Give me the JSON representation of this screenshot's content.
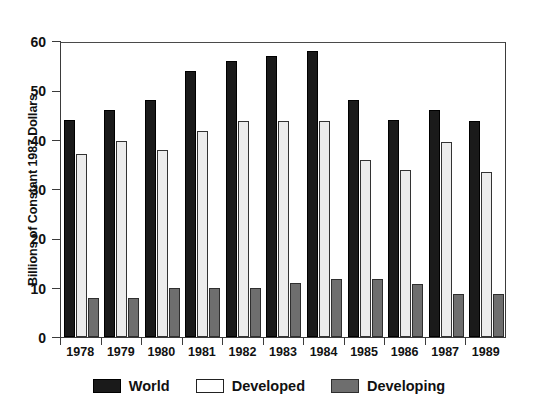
{
  "chart_data": {
    "type": "bar",
    "title": "",
    "subtitle": "",
    "xlabel": "",
    "ylabel": "Billions of Constant 1987 Dollars",
    "categories": [
      "1978",
      "1979",
      "1980",
      "1981",
      "1982",
      "1983",
      "1984",
      "1985",
      "1986",
      "1987",
      "1989"
    ],
    "series": [
      {
        "name": "World",
        "color": "#1a1a1a",
        "values": [
          44,
          46,
          48,
          54,
          56,
          57,
          58,
          48,
          44,
          46,
          43.8
        ]
      },
      {
        "name": "Developed",
        "color": "#ececec",
        "values": [
          37,
          39.8,
          38,
          41.8,
          43.8,
          43.8,
          43.8,
          35.8,
          33.8,
          39.6,
          33.5
        ]
      },
      {
        "name": "Developing",
        "color": "#6e6e6e",
        "values": [
          8,
          8,
          10,
          10,
          10,
          11,
          11.8,
          11.8,
          10.7,
          8.8,
          8.7
        ]
      }
    ],
    "ylim": [
      0,
      60
    ],
    "yticks": [
      0,
      10,
      20,
      30,
      40,
      50,
      60
    ],
    "ytick_labels": [
      "0",
      "10",
      "20",
      "30",
      "40",
      "50",
      "60"
    ],
    "grid": false,
    "legend_position": "bottom",
    "legend_entries": [
      "World",
      "Developed",
      "Developing"
    ]
  },
  "axis": {
    "y_title": "Billions of Constant 1987 Dollars"
  },
  "legend": {
    "items": [
      {
        "label": "World",
        "swatch": "world"
      },
      {
        "label": "Developed",
        "swatch": "developed"
      },
      {
        "label": "Developing",
        "swatch": "developing"
      }
    ]
  }
}
